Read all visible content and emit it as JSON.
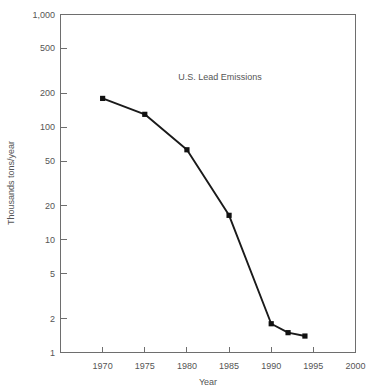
{
  "chart_data": {
    "type": "line",
    "title": "U.S. Lead Emissions",
    "xlabel": "Year",
    "ylabel": "Thousands tons/year",
    "yscale": "log",
    "xlim": [
      1965,
      2000
    ],
    "ylim": [
      1,
      1000
    ],
    "grid": false,
    "legend": "none",
    "x_ticks": [
      "1970",
      "1975",
      "1980",
      "1985",
      "1990",
      "1995",
      "2000"
    ],
    "x_tick_values": [
      1970,
      1975,
      1980,
      1985,
      1990,
      1995,
      2000
    ],
    "y_ticks": [
      "1,000",
      "500",
      "200",
      "100",
      "50",
      "20",
      "10",
      "5",
      "2",
      "1"
    ],
    "y_tick_values": [
      1000,
      500,
      200,
      100,
      50,
      20,
      10,
      5,
      2,
      1
    ],
    "series": [
      {
        "name": "U.S. Lead Emissions",
        "x": [
          1970,
          1975,
          1980,
          1985,
          1990,
          1992,
          1994
        ],
        "values": [
          180,
          130,
          63,
          16.5,
          1.8,
          1.5,
          1.4
        ],
        "marker": "square",
        "color": "#111111"
      }
    ]
  },
  "figure": {
    "title": "U.S. Lead Emissions",
    "x_axis_title": "Year",
    "y_axis_title": "Thousands tons/year"
  },
  "colors": {
    "line": "#111111",
    "frame": "#6e6e6e",
    "text": "#555555",
    "background": "#ffffff"
  }
}
